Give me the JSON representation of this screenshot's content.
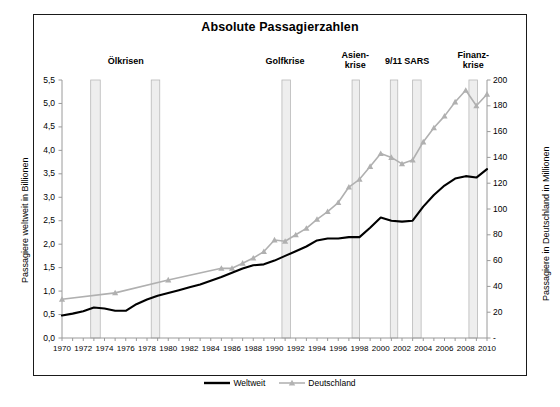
{
  "figure": {
    "title": "Absolute Passagierzahlen",
    "caption": ""
  },
  "axes": {
    "left": {
      "label": "Passagiere weltweit in Billionen",
      "ticks": [
        "0,0",
        "0,5",
        "1,0",
        "1,5",
        "2,0",
        "2,5",
        "3,0",
        "3,5",
        "4,0",
        "4,5",
        "5,0",
        "5,5"
      ],
      "min": 0,
      "max": 5.5
    },
    "right": {
      "label": "Passagiere in Deutschland in Millionen",
      "ticks": [
        "-",
        "20",
        "40",
        "60",
        "80",
        "100",
        "120",
        "140",
        "160",
        "180",
        "200"
      ],
      "min": 0,
      "max": 200
    },
    "x": {
      "ticks": [
        "1970",
        "1972",
        "1974",
        "1976",
        "1978",
        "1980",
        "1982",
        "1984",
        "1986",
        "1988",
        "1990",
        "1992",
        "1994",
        "1996",
        "1998",
        "2000",
        "2002",
        "2004",
        "2006",
        "2008",
        "2010"
      ],
      "min": 1970,
      "max": 2010
    }
  },
  "legend": {
    "items": [
      {
        "label": "Weltweit",
        "color": "#000000",
        "style": "line"
      },
      {
        "label": "Deutschland",
        "color": "#b3b3b3",
        "style": "line-marker"
      }
    ]
  },
  "annotations": [
    {
      "text": "Ölkrisen",
      "center_year": 1976.0
    },
    {
      "text": "Golfkrise",
      "center_year": 1991.0
    },
    {
      "text": "Asien-\nkrise",
      "center_year": 1997.6
    },
    {
      "text": "9/11",
      "center_year": 2001.2
    },
    {
      "text": "SARS",
      "center_year": 2003.4
    },
    {
      "text": "Finanz-\nkrise",
      "center_year": 2008.7
    }
  ],
  "crisis_bands": [
    {
      "name": "Ölkrise 1973",
      "start": 1972.7,
      "end": 1973.6
    },
    {
      "name": "Ölkrise 1979",
      "start": 1978.4,
      "end": 1979.2
    },
    {
      "name": "Golfkrise",
      "start": 1990.7,
      "end": 1991.5
    },
    {
      "name": "Asienkrise",
      "start": 1997.3,
      "end": 1998.0
    },
    {
      "name": "9/11",
      "start": 2000.9,
      "end": 2001.6
    },
    {
      "name": "SARS",
      "start": 2003.0,
      "end": 2003.8
    },
    {
      "name": "Finanzkrise",
      "start": 2008.3,
      "end": 2009.1
    }
  ],
  "colors": {
    "weltweit": "#000000",
    "deutschland": "#b0b0b0",
    "band": "#eeeeee",
    "band_border": "#b8b8b8",
    "axis": "#9a9a9a",
    "frame": "#1a1a1a",
    "grid": "#f2f2f2"
  },
  "chart_data": {
    "type": "line",
    "title": "Absolute Passagierzahlen",
    "xlabel": "",
    "ylabel": "Passagiere weltweit in Billionen",
    "y2label": "Passagiere in Deutschland in Millionen",
    "xlim": [
      1970,
      2010
    ],
    "ylim": [
      0,
      5.5
    ],
    "y2lim": [
      0,
      200
    ],
    "grid": false,
    "legend_position": "bottom",
    "x": [
      1970,
      1971,
      1972,
      1973,
      1974,
      1975,
      1976,
      1977,
      1978,
      1979,
      1980,
      1981,
      1982,
      1983,
      1984,
      1985,
      1986,
      1987,
      1988,
      1989,
      1990,
      1991,
      1992,
      1993,
      1994,
      1995,
      1996,
      1997,
      1998,
      1999,
      2000,
      2001,
      2002,
      2003,
      2004,
      2005,
      2006,
      2007,
      2008,
      2009,
      2010
    ],
    "series": [
      {
        "name": "Weltweit",
        "axis": "left",
        "unit": "Billionen",
        "values": [
          0.48,
          0.52,
          0.57,
          0.65,
          0.63,
          0.58,
          0.58,
          0.72,
          0.82,
          0.9,
          0.96,
          1.02,
          1.08,
          1.14,
          1.22,
          1.3,
          1.39,
          1.48,
          1.55,
          1.57,
          1.65,
          1.75,
          1.85,
          1.95,
          2.08,
          2.12,
          2.12,
          2.15,
          2.15,
          2.35,
          2.57,
          2.5,
          2.48,
          2.5,
          2.8,
          3.05,
          3.25,
          3.4,
          3.45,
          3.42,
          3.6
        ],
        "right_axis_equivalent_note": "Weltweit is plotted on the left axis (Billionen)"
      },
      {
        "name": "Deutschland",
        "axis": "right",
        "unit": "Millionen",
        "has_markers": true,
        "marker": "triangle",
        "values": [
          30,
          null,
          null,
          null,
          null,
          35,
          null,
          null,
          null,
          null,
          45,
          null,
          null,
          null,
          null,
          54,
          54,
          58,
          62,
          67,
          76,
          75,
          80,
          85,
          92,
          98,
          105,
          117,
          123,
          133,
          143,
          140,
          135,
          138,
          152,
          163,
          172,
          183,
          192,
          180,
          189
        ]
      }
    ]
  }
}
